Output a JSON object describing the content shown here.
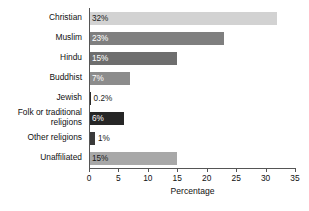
{
  "chart_data": {
    "type": "bar",
    "orientation": "horizontal",
    "title": "",
    "xlabel": "Percentage",
    "ylabel": "",
    "xlim": [
      0,
      35
    ],
    "xticks": [
      0,
      5,
      10,
      15,
      20,
      25,
      30,
      35
    ],
    "grid": false,
    "legend": false,
    "categories": [
      "Christian",
      "Muslim",
      "Hindu",
      "Buddhist",
      "Jewish",
      "Folk or traditional religions",
      "Other religions",
      "Unaffiliated"
    ],
    "values": [
      32,
      23,
      15,
      7,
      0.2,
      6,
      1,
      15
    ],
    "data_labels": [
      "32%",
      "23%",
      "15%",
      "7%",
      "0.2%",
      "6%",
      "1%",
      "15%"
    ],
    "bar_colors": [
      "#d2d2d2",
      "#7f7f7f",
      "#6e6e6e",
      "#8c8c8c",
      "#2b2b2b",
      "#262626",
      "#3a3a3a",
      "#a8a8a8"
    ],
    "label_colors": [
      "#1a1a1a",
      "#ffffff",
      "#ffffff",
      "#ffffff",
      "#1a1a1a",
      "#ffffff",
      "#1a1a1a",
      "#1a1a1a"
    ],
    "label_placement": [
      "inside",
      "inside",
      "inside",
      "inside",
      "outside",
      "inside",
      "outside",
      "inside"
    ]
  }
}
